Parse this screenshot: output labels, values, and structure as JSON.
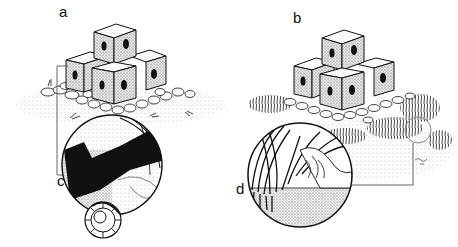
{
  "figure": {
    "colors": {
      "ink": "#111111",
      "paper": "#ffffff",
      "stipple": "#8a8a8a",
      "bracket": "#555555"
    },
    "panels": [
      {
        "id": "a",
        "label": "a",
        "subject": "stacked perforated concrete cubes on rubble mound, sparse sediment"
      },
      {
        "id": "b",
        "label": "b",
        "subject": "stacked perforated concrete cubes on rubble mound with dense algal/seagrass growth"
      },
      {
        "id": "c",
        "label": "c",
        "subject": "circular magnified inset: cryptic fauna in cube crevice with shell (nautilus-like)"
      },
      {
        "id": "d",
        "label": "d",
        "subject": "circular magnified inset: seagrass blades and fauna over sediment"
      }
    ],
    "signature": "artist signature (illegible)"
  }
}
